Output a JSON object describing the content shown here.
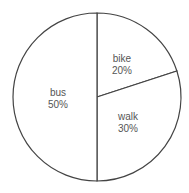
{
  "chart_data": {
    "type": "pie",
    "title": "",
    "categories": [
      "bike",
      "walk",
      "bus"
    ],
    "values": [
      20,
      30,
      50
    ],
    "labels": [
      "20%",
      "30%",
      "50%"
    ],
    "start_angle_deg": 0,
    "direction": "clockwise",
    "legend": "none",
    "slice_fill": "#ffffff",
    "slice_stroke": "#444444"
  },
  "labels": {
    "bike": {
      "name": "bike",
      "pct": "20%"
    },
    "walk": {
      "name": "walk",
      "pct": "30%"
    },
    "bus": {
      "name": "bus",
      "pct": "50%"
    }
  }
}
